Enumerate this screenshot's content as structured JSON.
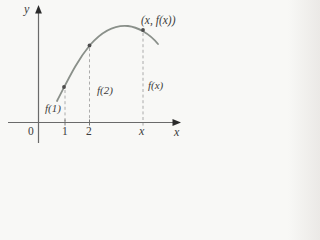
{
  "figure": {
    "type": "function-graph-sketch",
    "colors": {
      "background": "#f8f8f6",
      "axis": "#6a6a6a",
      "arrow": "#2b2b2b",
      "curve": "#8a908a",
      "dash": "#a3a3a3",
      "dot": "#4d4d4d",
      "text": "#3c3c3c"
    },
    "labels": {
      "y_axis": "y",
      "x_axis": "x",
      "origin": "0",
      "tick1": "1",
      "tick2": "2",
      "tickx": "x",
      "f1": "f(1)",
      "f2": "f(2)",
      "fx": "f(x)",
      "point": "(x, f(x))"
    },
    "geometry": {
      "curve_path": "M57 101 C68 80 76 62 90 45 C104 29 118 25 128 26 C137 27 149 33 158 44",
      "y_axis_path": "M38.5 9 L38.5 143",
      "x_axis_path": "M8 122.5 L176 122.5",
      "y_arrow_path": "M38.5 5 L35.1 13.5 L41.9 13.5 Z",
      "x_arrow_path": "M181 122.5 L172.5 119.1 L172.5 125.9 Z",
      "dash1_path": "M65 90 L65 121",
      "dash2_path": "M89.5 48 L89.5 121",
      "dashx_path": "M143 33 L143 126",
      "tick1_path": "M65 119.5 L65 125.5",
      "tick2_path": "M89.5 119.5 L89.5 125.5",
      "marked_points": {
        "p1": {
          "x": 64,
          "y": 87
        },
        "p2": {
          "x": 89.5,
          "y": 45.5
        },
        "px": {
          "x": 143,
          "y": 30
        }
      }
    }
  }
}
